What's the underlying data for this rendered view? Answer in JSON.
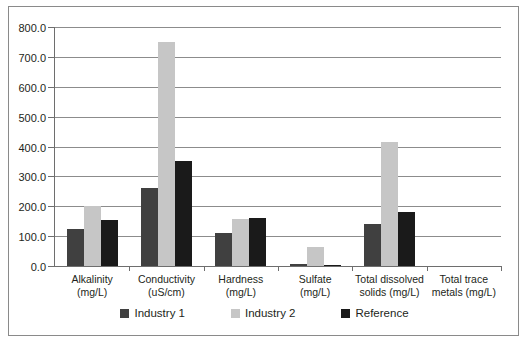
{
  "chart_data": {
    "type": "bar",
    "title": "",
    "subtitle": "",
    "xlabel": "",
    "ylabel": "",
    "ylim": [
      0,
      800
    ],
    "ytick_step": 100,
    "ytick_labels": [
      "0.0",
      "100.0",
      "200.0",
      "300.0",
      "400.0",
      "500.0",
      "600.0",
      "700.0",
      "800.0"
    ],
    "ytick_values": [
      0,
      100,
      200,
      300,
      400,
      500,
      600,
      700,
      800
    ],
    "grid": true,
    "legend_position": "bottom",
    "categories": [
      {
        "line1": "Alkalinity",
        "line2": "(mg/L)"
      },
      {
        "line1": "Conductivity",
        "line2": "(uS/cm)"
      },
      {
        "line1": "Hardness",
        "line2": "(mg/L)"
      },
      {
        "line1": "Sulfate",
        "line2": "(mg/L)"
      },
      {
        "line1": "Total dissolved",
        "line2": "solids (mg/L)"
      },
      {
        "line1": "Total trace",
        "line2": "metals (mg/L)"
      }
    ],
    "series": [
      {
        "name": "Industry 1",
        "color": "#404040",
        "values": [
          125,
          260,
          110,
          8,
          140,
          0
        ]
      },
      {
        "name": "Industry 2",
        "color": "#c6c6c6",
        "values": [
          202,
          750,
          157,
          65,
          415,
          0
        ]
      },
      {
        "name": "Reference",
        "color": "#1a1a1a",
        "values": [
          155,
          353,
          162,
          2,
          182,
          0
        ]
      }
    ]
  },
  "frame": {
    "border_color": "#8a8a8a",
    "background": "#ffffff"
  }
}
